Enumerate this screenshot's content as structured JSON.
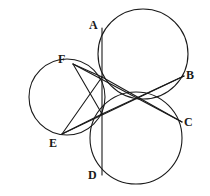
{
  "figure": {
    "background_color": "#ffffff",
    "stroke_color": "#1a1a1a",
    "label_color": "#1a1a1a",
    "stroke_width": 1.1,
    "canvas": {
      "width": 210,
      "height": 196
    }
  },
  "chart_data": {
    "type": "diagram",
    "xlabel": "",
    "ylabel": "",
    "xlim": [
      0,
      210
    ],
    "ylim": [
      0,
      196
    ],
    "grid": false,
    "legend": "none",
    "circles": [
      {
        "name": "top-right-circle",
        "cx": 143,
        "cy": 54,
        "r": 45
      },
      {
        "name": "bottom-right-circle",
        "cx": 136,
        "cy": 138,
        "r": 46
      },
      {
        "name": "left-circle",
        "cx": 67,
        "cy": 97,
        "r": 38
      }
    ],
    "points": [
      {
        "name": "A",
        "x": 102,
        "y": 28,
        "label_x": 89,
        "label_y": 19
      },
      {
        "name": "B",
        "x": 184,
        "y": 76,
        "label_x": 186,
        "label_y": 69
      },
      {
        "name": "C",
        "x": 182,
        "y": 122,
        "label_x": 184,
        "label_y": 116
      },
      {
        "name": "D",
        "x": 102,
        "y": 175,
        "label_x": 88,
        "label_y": 169
      },
      {
        "name": "E",
        "x": 62,
        "y": 134,
        "label_x": 49,
        "label_y": 137
      },
      {
        "name": "F",
        "x": 73,
        "y": 64,
        "label_x": 58,
        "label_y": 53
      },
      {
        "name": "P",
        "x": 102,
        "y": 77,
        "label_x": null,
        "label_y": null
      },
      {
        "name": "Q",
        "x": 102,
        "y": 114,
        "label_x": null,
        "label_y": null
      },
      {
        "name": "X",
        "x": 141,
        "y": 100,
        "label_x": null,
        "label_y": null
      }
    ],
    "segments": [
      {
        "name": "segment-A-D",
        "from": "A",
        "to": "D",
        "x1": 102,
        "y1": 28,
        "x2": 102,
        "y2": 175
      },
      {
        "name": "segment-F-P",
        "from": "F",
        "to": "P",
        "x1": 73,
        "y1": 64,
        "x2": 102,
        "y2": 77
      },
      {
        "name": "segment-F-Q",
        "from": "F",
        "to": "Q",
        "x1": 73,
        "y1": 64,
        "x2": 102,
        "y2": 114
      },
      {
        "name": "segment-E-Q",
        "from": "E",
        "to": "Q",
        "x1": 62,
        "y1": 134,
        "x2": 102,
        "y2": 114
      },
      {
        "name": "segment-E-P",
        "from": "E",
        "to": "P",
        "x1": 62,
        "y1": 134,
        "x2": 102,
        "y2": 77
      },
      {
        "name": "segment-P-C",
        "from": "P",
        "to": "C",
        "x1": 102,
        "y1": 77,
        "x2": 182,
        "y2": 122
      },
      {
        "name": "segment-Q-B",
        "from": "Q",
        "to": "B",
        "x1": 102,
        "y1": 114,
        "x2": 184,
        "y2": 76
      },
      {
        "name": "segment-F-C",
        "from": "F",
        "to": "C",
        "x1": 73,
        "y1": 64,
        "x2": 182,
        "y2": 122
      },
      {
        "name": "segment-E-B",
        "from": "E",
        "to": "B",
        "x1": 62,
        "y1": 134,
        "x2": 184,
        "y2": 76
      }
    ],
    "labels": [
      "A",
      "B",
      "C",
      "D",
      "E",
      "F"
    ]
  }
}
